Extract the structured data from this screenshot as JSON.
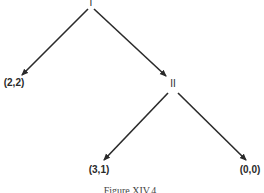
{
  "diagram": {
    "type": "game-tree",
    "nodes": {
      "root": {
        "label": "I"
      },
      "player2": {
        "label": "II"
      }
    },
    "payoffs": {
      "left": "(2,2)",
      "middle": "(3,1)",
      "right": "(0,0)"
    },
    "edges": [
      {
        "from": "I",
        "to": "(2,2)"
      },
      {
        "from": "I",
        "to": "II"
      },
      {
        "from": "II",
        "to": "(3,1)"
      },
      {
        "from": "II",
        "to": "(0,0)"
      }
    ],
    "caption": "Figure XIV.4",
    "line_color": "#2a2a2a"
  }
}
